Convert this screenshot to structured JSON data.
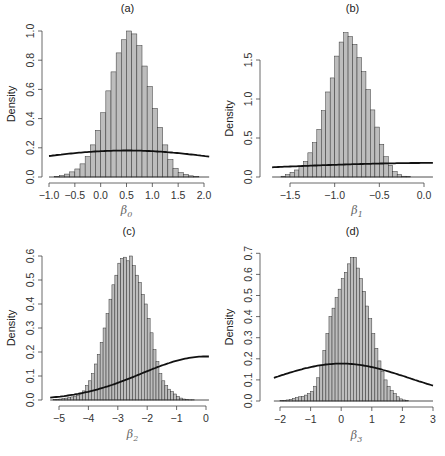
{
  "chart_data": [
    {
      "type": "bar",
      "panel": "(a)",
      "title": "(a)",
      "xlabel": "β0",
      "xlabel_symbol": "β",
      "xlabel_sub": "0",
      "ylabel": "Density",
      "xlim": [
        -1.0,
        2.1
      ],
      "ylim": [
        0,
        1.0
      ],
      "xticks": [
        "-1.0",
        "-0.5",
        "0.0",
        "0.5",
        "1.0",
        "1.5",
        "2.0"
      ],
      "xtick_values": [
        -1.0,
        -0.5,
        0.0,
        0.5,
        1.0,
        1.5,
        2.0
      ],
      "yticks": [
        "0.0",
        "0.2",
        "0.4",
        "0.6",
        "0.8",
        "1.0"
      ],
      "ytick_values": [
        0.0,
        0.2,
        0.4,
        0.6,
        0.8,
        1.0
      ],
      "bin_start": -0.9,
      "bin_width": 0.1,
      "values": [
        0.003,
        0.01,
        0.02,
        0.035,
        0.055,
        0.09,
        0.14,
        0.22,
        0.32,
        0.44,
        0.59,
        0.72,
        0.85,
        0.94,
        1.0,
        0.98,
        0.9,
        0.76,
        0.62,
        0.47,
        0.34,
        0.22,
        0.12,
        0.06,
        0.03,
        0.018,
        0.008,
        0.003
      ],
      "prior_curve": {
        "type": "normal",
        "mean": 0.5,
        "sd": 2.2
      },
      "grid": false
    },
    {
      "type": "bar",
      "panel": "(b)",
      "title": "(b)",
      "xlabel": "β1",
      "xlabel_symbol": "β",
      "xlabel_sub": "1",
      "ylabel": "Density",
      "xlim": [
        -1.7,
        0.1
      ],
      "ylim": [
        0,
        1.9
      ],
      "xticks": [
        "-1.5",
        "-1.0",
        "-0.5",
        "0.0"
      ],
      "xtick_values": [
        -1.5,
        -1.0,
        -0.5,
        0.0
      ],
      "yticks": [
        "0.0",
        "0.5",
        "1.0",
        "1.5"
      ],
      "ytick_values": [
        0.0,
        0.5,
        1.0,
        1.5
      ],
      "bin_start": -1.6,
      "bin_width": 0.05,
      "values": [
        0.01,
        0.03,
        0.06,
        0.09,
        0.14,
        0.2,
        0.31,
        0.44,
        0.61,
        0.85,
        1.09,
        1.27,
        1.55,
        1.73,
        1.85,
        1.8,
        1.7,
        1.53,
        1.35,
        1.12,
        0.86,
        0.64,
        0.42,
        0.26,
        0.15,
        0.07,
        0.03,
        0.01,
        0.005
      ],
      "prior_curve": {
        "type": "normal",
        "mean": 0.2,
        "sd": 2.2
      },
      "grid": false
    },
    {
      "type": "bar",
      "panel": "(c)",
      "title": "(c)",
      "xlabel": "β2",
      "xlabel_symbol": "β",
      "xlabel_sub": "2",
      "ylabel": "Density",
      "xlim": [
        -5.3,
        0.1
      ],
      "ylim": [
        0,
        0.6
      ],
      "xticks": [
        "-5",
        "-4",
        "-3",
        "-2",
        "-1",
        "0"
      ],
      "xtick_values": [
        -5,
        -4,
        -3,
        -2,
        -1,
        0
      ],
      "yticks": [
        "0.0",
        "0.1",
        "0.2",
        "0.3",
        "0.4",
        "0.5",
        "0.6"
      ],
      "ytick_values": [
        0.0,
        0.1,
        0.2,
        0.3,
        0.4,
        0.5,
        0.6
      ],
      "bin_start": -5.2,
      "bin_width": 0.1,
      "values": [
        0.002,
        0.003,
        0.004,
        0.006,
        0.008,
        0.01,
        0.013,
        0.016,
        0.02,
        0.028,
        0.038,
        0.06,
        0.08,
        0.11,
        0.15,
        0.19,
        0.24,
        0.3,
        0.36,
        0.42,
        0.48,
        0.52,
        0.57,
        0.59,
        0.595,
        0.58,
        0.6,
        0.56,
        0.52,
        0.49,
        0.44,
        0.4,
        0.34,
        0.28,
        0.21,
        0.16,
        0.11,
        0.08,
        0.06,
        0.045,
        0.035,
        0.025,
        0.015,
        0.008,
        0.004,
        0.002,
        0.001,
        0.001
      ],
      "prior_curve": {
        "type": "normal",
        "mean": 0.0,
        "sd": 2.2
      },
      "grid": false
    },
    {
      "type": "bar",
      "panel": "(d)",
      "title": "(d)",
      "xlabel": "β3",
      "xlabel_symbol": "β",
      "xlabel_sub": "3",
      "ylabel": "Density",
      "xlim": [
        -2.2,
        3.0
      ],
      "ylim": [
        0,
        0.7
      ],
      "xticks": [
        "-2",
        "-1",
        "0",
        "1",
        "2",
        "3"
      ],
      "xtick_values": [
        -2,
        -1,
        0,
        1,
        2,
        3
      ],
      "yticks": [
        "0.0",
        "0.1",
        "0.2",
        "0.3",
        "0.4",
        "0.5",
        "0.6",
        "0.7"
      ],
      "ytick_values": [
        0.0,
        0.1,
        0.2,
        0.3,
        0.4,
        0.5,
        0.6,
        0.7
      ],
      "bin_start": -2.0,
      "bin_width": 0.1,
      "values": [
        0.002,
        0.003,
        0.005,
        0.008,
        0.012,
        0.016,
        0.02,
        0.022,
        0.028,
        0.035,
        0.045,
        0.07,
        0.11,
        0.17,
        0.24,
        0.32,
        0.4,
        0.44,
        0.49,
        0.53,
        0.58,
        0.61,
        0.65,
        0.68,
        0.68,
        0.63,
        0.58,
        0.52,
        0.45,
        0.39,
        0.32,
        0.25,
        0.19,
        0.14,
        0.1,
        0.07,
        0.05,
        0.035,
        0.02,
        0.01,
        0.005,
        0.002
      ],
      "prior_curve": {
        "type": "normal",
        "mean": 0.0,
        "sd": 2.25
      },
      "grid": false
    }
  ],
  "colors": {
    "bar_fill": "#bdbdbd",
    "bar_stroke": "#333333",
    "curve": "#111111",
    "axis": "#444444"
  }
}
